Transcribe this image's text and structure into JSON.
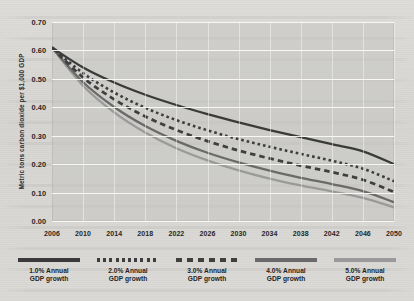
{
  "chart_data": {
    "type": "line",
    "title": "",
    "xlabel": "",
    "ylabel": "Metric tons carbon dioxide per $1,000 GDP",
    "x": [
      2006,
      2010,
      2014,
      2018,
      2022,
      2026,
      2030,
      2034,
      2038,
      2042,
      2046,
      2050
    ],
    "xtick_labels": [
      "2006",
      "2010",
      "2014",
      "2018",
      "2022",
      "2026",
      "2030",
      "2034",
      "2038",
      "2042",
      "2046",
      "2050"
    ],
    "ytick_labels": [
      "0.00",
      "0.10",
      "0.20",
      "0.30",
      "0.40",
      "0.50",
      "0.60",
      "0.70"
    ],
    "ytick_values": [
      0.0,
      0.1,
      0.2,
      0.3,
      0.4,
      0.5,
      0.6,
      0.7
    ],
    "ylim": [
      0.0,
      0.7
    ],
    "xlim": [
      2006,
      2050
    ],
    "grid": "horizontal",
    "legend_position": "bottom",
    "series": [
      {
        "name": "1.0% Annual GDP growth",
        "style": "solid",
        "color": "#3a3a3a",
        "values": [
          0.61,
          0.54,
          0.487,
          0.444,
          0.408,
          0.376,
          0.347,
          0.32,
          0.295,
          0.27,
          0.245,
          0.2
        ]
      },
      {
        "name": "2.0% Annual GDP growth",
        "style": "dotted",
        "color": "#3d3d3d",
        "values": [
          0.61,
          0.52,
          0.452,
          0.398,
          0.355,
          0.319,
          0.288,
          0.261,
          0.236,
          0.212,
          0.184,
          0.14
        ]
      },
      {
        "name": "3.0% Annual GDP growth",
        "style": "dashed",
        "color": "#3f3f3f",
        "values": [
          0.61,
          0.505,
          0.428,
          0.368,
          0.32,
          0.281,
          0.248,
          0.22,
          0.195,
          0.172,
          0.145,
          0.102
        ]
      },
      {
        "name": "4.0% Annual GDP growth",
        "style": "solid",
        "color": "#6a6a6a",
        "values": [
          0.61,
          0.488,
          0.401,
          0.334,
          0.282,
          0.24,
          0.206,
          0.177,
          0.152,
          0.13,
          0.105,
          0.066
        ]
      },
      {
        "name": "5.0% Annual GDP growth",
        "style": "solid",
        "color": "#9a9a9a",
        "values": [
          0.61,
          0.476,
          0.382,
          0.311,
          0.256,
          0.213,
          0.178,
          0.149,
          0.125,
          0.104,
          0.081,
          0.048
        ]
      }
    ]
  },
  "legend": {
    "items": [
      {
        "label_line1": "1.0% Annual",
        "label_line2": "GDP growth",
        "style": "solid",
        "color": "#3a3a3a"
      },
      {
        "label_line1": "2.0% Annual",
        "label_line2": "GDP growth",
        "style": "dotted",
        "color": "#3d3d3d"
      },
      {
        "label_line1": "3.0% Annual",
        "label_line2": "GDP growth",
        "style": "dashed",
        "color": "#3f3f3f"
      },
      {
        "label_line1": "4.0% Annual",
        "label_line2": "GDP growth",
        "style": "solid",
        "color": "#6a6a6a"
      },
      {
        "label_line1": "5.0% Annual",
        "label_line2": "GDP growth",
        "style": "solid",
        "color": "#9a9a9a"
      }
    ]
  }
}
